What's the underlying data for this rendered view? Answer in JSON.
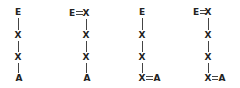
{
  "diagram": {
    "structures": [
      {
        "id": "structure-1",
        "top": "E",
        "chain": [
          "X",
          "X"
        ],
        "bottom": "A",
        "top_bond": "single",
        "bottom_bond": "single"
      },
      {
        "id": "structure-2",
        "top_left": "E",
        "top": "X",
        "chain": [
          "X",
          "X"
        ],
        "bottom": "A",
        "top_bond": "double",
        "bottom_bond": "single"
      },
      {
        "id": "structure-3",
        "top": "E",
        "chain": [
          "X",
          "X"
        ],
        "bottom": "X",
        "bottom_right": "A",
        "top_bond": "single",
        "bottom_bond": "double"
      },
      {
        "id": "structure-4",
        "top_left": "E",
        "top": "X",
        "chain": [
          "X",
          "X"
        ],
        "bottom": "X",
        "bottom_right": "A",
        "top_bond": "double",
        "bottom_bond": "double"
      }
    ]
  }
}
